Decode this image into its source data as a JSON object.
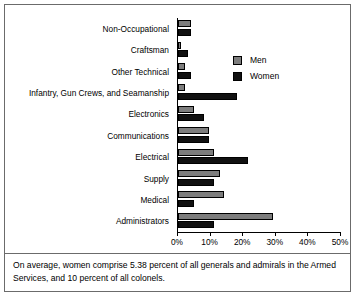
{
  "figure": {
    "caption": "On average, women comprise 5.38 percent of all generals and admirals in the Armed Services, and 10 percent of all colonels."
  },
  "legend": {
    "position": "top-right-inside",
    "entries": [
      {
        "label": "Men",
        "color": "#7d7d7d",
        "swatch_name": "legend-swatch-men"
      },
      {
        "label": "Women",
        "color": "#111111",
        "swatch_name": "legend-swatch-women"
      }
    ]
  },
  "axis": {
    "ticks": [
      "0%",
      "10%",
      "20%",
      "30%",
      "40%",
      "50%"
    ],
    "tick_values": [
      0,
      10,
      20,
      30,
      40,
      50
    ],
    "min": 0,
    "max": 50
  },
  "chart_data": {
    "type": "bar",
    "orientation": "horizontal",
    "title": "",
    "subtitle": "",
    "xlabel": "",
    "ylabel": "",
    "xlim": [
      0,
      50
    ],
    "grid": false,
    "legend_position": "top-right-inside",
    "categories": [
      "Non-Occupational",
      "Craftsman",
      "Other Technical",
      "Infantry, Gun Crews, and Seamanship",
      "Electronics",
      "Communications",
      "Electrical",
      "Supply",
      "Medical",
      "Administrators"
    ],
    "series": [
      {
        "name": "Men",
        "color": "#7d7d7d",
        "values": [
          4,
          1,
          2,
          2,
          5,
          9.5,
          11,
          13,
          14,
          29
        ]
      },
      {
        "name": "Women",
        "color": "#111111",
        "values": [
          4,
          3,
          4,
          18,
          8,
          9.5,
          21.5,
          11,
          5,
          11
        ]
      }
    ],
    "annotations": [
      "On average, women comprise 5.38 percent of all generals and admirals in the Armed Services, and 10 percent of all colonels."
    ]
  }
}
